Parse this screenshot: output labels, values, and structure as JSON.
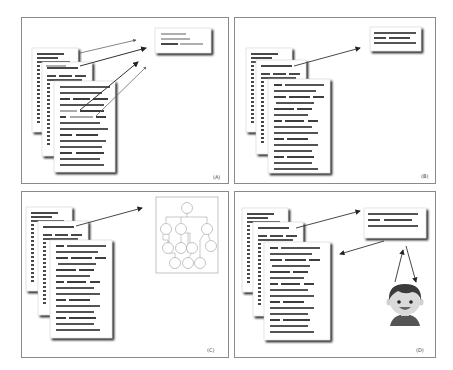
{
  "figure": {
    "header_left_fragment": "",
    "panels": [
      {
        "id": "A",
        "label": "(A)",
        "description": "Multiple documents with highlighted sentences extracted into a summary box"
      },
      {
        "id": "B",
        "label": "(B)",
        "description": "Multiple documents summarized into a single summary box"
      },
      {
        "id": "C",
        "label": "(C)",
        "description": "Multiple documents mapped to a graph structure"
      },
      {
        "id": "D",
        "label": "(D)",
        "description": "Multiple documents summarized with human feedback loop"
      }
    ]
  },
  "colors": {
    "panel_border": "#8a8a8a",
    "text_line": "#1a1a1a",
    "highlight_line": "#9a9a9a",
    "arrow": "#333333",
    "shadow": "#2a2a2a",
    "graph_border": "#9a9a9a",
    "avatar_hair": "#3b3b3b",
    "avatar_skin": "#d9d9d9",
    "avatar_shirt": "#555555"
  }
}
